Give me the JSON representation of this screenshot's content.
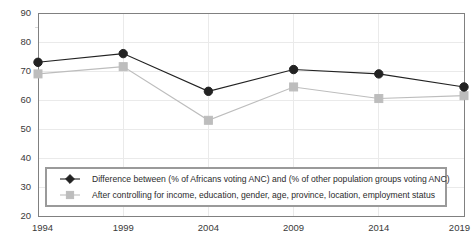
{
  "chart_data": {
    "type": "line",
    "title": "",
    "subtitle": "",
    "xlabel": "",
    "ylabel": "",
    "categories": [
      "1994",
      "1999",
      "2004",
      "2009",
      "2014",
      "2019"
    ],
    "x": [
      1994,
      1999,
      2004,
      2009,
      2014,
      2019
    ],
    "xlim": [
      1994,
      2019
    ],
    "ylim": [
      20,
      90
    ],
    "yticks": [
      20,
      30,
      40,
      50,
      60,
      70,
      80,
      90
    ],
    "ytick_labels": [
      "20",
      "30",
      "40",
      "50",
      "60",
      "70",
      "80",
      "90"
    ],
    "xtick_labels": [
      "1994",
      "1999",
      "2004",
      "2009",
      "2014",
      "2019"
    ],
    "grid": true,
    "grid_axis": "both",
    "legend_position": "lower-center-inside",
    "series": [
      {
        "name": "Difference between (% of Africans voting ANC) and (% of other population groups voting ANC)",
        "values": [
          73,
          76,
          63,
          70.5,
          69,
          64.5
        ],
        "color": "#222222",
        "marker": "circle",
        "marker_size": 4.2,
        "line_width": 1.1
      },
      {
        "name": "After controlling for income, education, gender, age, province, location, employment status",
        "values": [
          69,
          71.5,
          53,
          64.5,
          60.5,
          61.5
        ],
        "color": "#bdbdbd",
        "marker": "square",
        "marker_size": 4.0,
        "line_width": 1.1
      }
    ]
  },
  "axes": {
    "y_tick_labels": [
      "90",
      "80",
      "70",
      "60",
      "50",
      "40",
      "30",
      "20"
    ],
    "x_tick_labels": [
      "1994",
      "1999",
      "2004",
      "2009",
      "2014",
      "2019"
    ]
  },
  "legend": {
    "entries": [
      {
        "label": "Difference between (% of Africans voting ANC) and (% of other population groups voting ANC)",
        "marker": "diamond-icon",
        "color": "#222222"
      },
      {
        "label": "After controlling for income, education, gender, age, province, location, employment status",
        "marker": "square-icon",
        "color": "#bdbdbd"
      }
    ],
    "border_color": "#9a9a9a",
    "background": "#ffffff"
  },
  "colors": {
    "plot_border": "#808080",
    "grid": "#eaeaea",
    "axis_text": "#3a3a3a",
    "series_primary": "#222222",
    "series_secondary": "#bdbdbd",
    "background": "#ffffff"
  }
}
